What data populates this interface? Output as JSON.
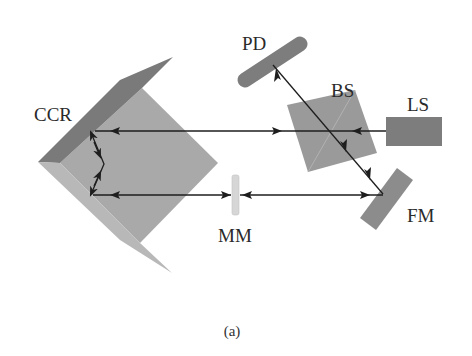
{
  "figure": {
    "caption": "(a)",
    "labels": {
      "ccr": "CCR",
      "pd": "PD",
      "bs": "BS",
      "ls": "LS",
      "mm": "MM",
      "fm": "FM"
    },
    "components": [
      {
        "id": "CCR",
        "name": "corner cube reflector"
      },
      {
        "id": "PD",
        "name": "photodetector"
      },
      {
        "id": "BS",
        "name": "beam splitter"
      },
      {
        "id": "LS",
        "name": "laser source"
      },
      {
        "id": "MM",
        "name": "movable mirror"
      },
      {
        "id": "FM",
        "name": "fixed mirror"
      }
    ],
    "colors": {
      "background": "#ffffff",
      "ccr_face": "#a9a9a9",
      "ccr_top_edge": "#7a7a7a",
      "ccr_bottom_edge": "#b8b8b8",
      "component_dark": "#7d7d7d",
      "bs": "#9a9a9a",
      "mm": "#d6d6d6",
      "beam": "#1e1e1e",
      "text": "#2a2a2a"
    }
  }
}
